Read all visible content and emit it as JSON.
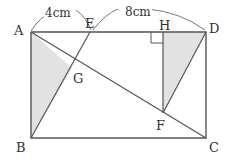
{
  "figure": {
    "stroke_color": "#555555",
    "shade_color": "#e2e2e2",
    "background": "#ffffff"
  },
  "vertices": [
    {
      "name": "A",
      "label": "A",
      "x": 31,
      "y": 32,
      "label_x": 14,
      "label_y": 24
    },
    {
      "name": "B",
      "label": "B",
      "x": 31,
      "y": 138,
      "label_x": 16,
      "label_y": 141
    },
    {
      "name": "C",
      "label": "C",
      "x": 206,
      "y": 138,
      "label_x": 209,
      "label_y": 141
    },
    {
      "name": "D",
      "label": "D",
      "x": 206,
      "y": 32,
      "label_x": 209,
      "label_y": 22
    },
    {
      "name": "E",
      "label": "E",
      "x": 90,
      "y": 32,
      "label_x": 85,
      "label_y": 17
    },
    {
      "name": "F",
      "label": "F",
      "x": 163,
      "y": 113,
      "label_x": 156,
      "label_y": 119
    },
    {
      "name": "G",
      "label": "G",
      "x": 72,
      "y": 68,
      "label_x": 73,
      "label_y": 72
    },
    {
      "name": "H",
      "label": "H",
      "x": 163,
      "y": 32,
      "label_x": 159,
      "label_y": 19
    }
  ],
  "dimensions": [
    {
      "name": "segment-AE",
      "label": "4cm",
      "from": "A",
      "to": "E",
      "label_x": 44,
      "label_y": 7
    },
    {
      "name": "segment-ED",
      "label": "8cm",
      "from": "E",
      "to": "D",
      "label_x": 124,
      "label_y": 6
    }
  ],
  "shaded_regions": [
    {
      "name": "triangle-ABG",
      "points": "31,32 72,68 31,138"
    },
    {
      "name": "triangle-HDF",
      "points": "163,32 206,32 163,113"
    }
  ],
  "lines": [
    {
      "name": "rectangle-outline",
      "points": "31,32 206,32 206,138 31,138 31,32"
    },
    {
      "name": "diagonal-AC",
      "x1": 31,
      "y1": 32,
      "x2": 206,
      "y2": 138
    },
    {
      "name": "segment-EB",
      "x1": 90,
      "y1": 32,
      "x2": 31,
      "y2": 138
    },
    {
      "name": "segment-HF",
      "x1": 163,
      "y1": 32,
      "x2": 163,
      "y2": 113
    },
    {
      "name": "segment-FD",
      "x1": 163,
      "y1": 113,
      "x2": 206,
      "y2": 32
    }
  ],
  "arcs": [
    {
      "name": "arc-AE-left",
      "d": "M 31 31 Q 40 16 56 10"
    },
    {
      "name": "arc-AE-right",
      "d": "M 76 10 Q 86 17 91 30"
    },
    {
      "name": "arc-ED-left",
      "d": "M 93 30 Q 105 14 118 9"
    },
    {
      "name": "arc-ED-right",
      "d": "M 148 9 Q 180 12 205 30"
    }
  ],
  "right_angle": {
    "name": "right-angle-mark-H",
    "points": "151,32 151,43 163,43",
    "vertex": "H"
  }
}
